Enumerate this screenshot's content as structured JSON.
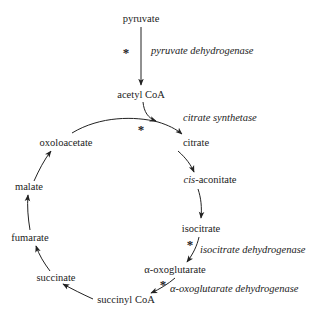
{
  "diagram": {
    "type": "metabolic-cycle",
    "nodes": {
      "pyruvate": "pyruvate",
      "acetyl_coa": "acetyl CoA",
      "oxoloacetate": "oxoloacetate",
      "citrate": "citrate",
      "cis_aconitate_prefix": "cis",
      "cis_aconitate_suffix": "-aconitate",
      "isocitrate": "isocitrate",
      "alpha_oxoglutarate": "α-oxoglutarate",
      "succinyl_coa": "succinyl CoA",
      "succinate": "succinate",
      "fumarate": "fumarate",
      "malate": "malate"
    },
    "enzymes": {
      "pyruvate_dehydrogenase": "pyruvate dehydrogenase",
      "citrate_synthetase": "citrate synthetase",
      "isocitrate_dehydrogenase": "isocitrate dehydrogenase",
      "alpha_oxoglutarate_dehydrogenase": "α-oxoglutarate dehydrogenase"
    },
    "marker": "*",
    "edges": [
      {
        "from": "pyruvate",
        "to": "acetyl CoA",
        "enzyme": "pyruvate dehydrogenase",
        "marked": true
      },
      {
        "from": "acetyl CoA + oxoloacetate",
        "to": "citrate",
        "enzyme": "citrate synthetase",
        "marked": true
      },
      {
        "from": "citrate",
        "to": "cis-aconitate",
        "marked": false
      },
      {
        "from": "cis-aconitate",
        "to": "isocitrate",
        "marked": false
      },
      {
        "from": "isocitrate",
        "to": "α-oxoglutarate",
        "enzyme": "isocitrate dehydrogenase",
        "marked": true
      },
      {
        "from": "α-oxoglutarate",
        "to": "succinyl CoA",
        "enzyme": "α-oxoglutarate dehydrogenase",
        "marked": true
      },
      {
        "from": "succinyl CoA",
        "to": "succinate",
        "marked": false
      },
      {
        "from": "succinate",
        "to": "fumarate",
        "marked": false
      },
      {
        "from": "fumarate",
        "to": "malate",
        "marked": false
      },
      {
        "from": "malate",
        "to": "oxoloacetate",
        "marked": false
      }
    ]
  }
}
